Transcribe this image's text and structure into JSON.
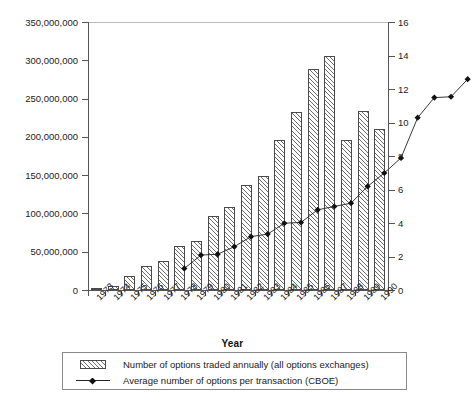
{
  "chart_data": {
    "type": "bar",
    "title": "",
    "xlabel": "Year",
    "ylabel": "",
    "ylabel_right": "",
    "grid": false,
    "legend_position": "bottom",
    "categories": [
      "1973",
      "1974",
      "1975",
      "1976",
      "1977",
      "1978",
      "1979",
      "1980",
      "1981",
      "1982",
      "1983",
      "1984",
      "1985",
      "1986",
      "1987",
      "1988",
      "1989",
      "1990"
    ],
    "ylim": [
      0,
      350000000
    ],
    "yticks": [
      0,
      50000000,
      100000000,
      150000000,
      200000000,
      250000000,
      300000000,
      350000000
    ],
    "ytick_labels": [
      "0",
      "50,000,000",
      "100,000,000",
      "150,000,000",
      "200,000,000",
      "250,000,000",
      "300,000,000",
      "350,000,000"
    ],
    "ylim_right": [
      0,
      16
    ],
    "yticks_right": [
      0,
      2,
      4,
      6,
      8,
      10,
      12,
      14,
      16
    ],
    "ytick_labels_right": [
      "0",
      "2",
      "4",
      "6",
      "8",
      "10",
      "12",
      "14",
      "16"
    ],
    "series": [
      {
        "name": "Number of options traded annually (all options exchanges)",
        "type": "bar",
        "axis": "left",
        "values": [
          1000000,
          5000000,
          18000000,
          31000000,
          38000000,
          57000000,
          64000000,
          97000000,
          109000000,
          137000000,
          149000000,
          196000000,
          233000000,
          288000000,
          306000000,
          196000000,
          234000000,
          210000000
        ]
      },
      {
        "name": "Average number of options per transaction (CBOE)",
        "type": "line",
        "axis": "right",
        "marker": "diamond",
        "values": [
          2.6,
          3.4,
          3.45,
          3.9,
          4.5,
          4.65,
          5.3,
          5.35,
          6.1,
          6.3,
          6.5,
          7.5,
          8.3,
          9.2,
          11.6,
          12.8,
          12.85,
          13.9
        ]
      }
    ]
  },
  "legend": {
    "items": [
      {
        "label": "Number of options traded annually (all options exchanges)",
        "swatch": "hatched-bar-swatch"
      },
      {
        "label": "Average number of options per transaction (CBOE)",
        "swatch": "diamond-line-swatch"
      }
    ]
  },
  "colors": {
    "axis": "#555555",
    "bar_outline": "#4a4a4a",
    "bar_hatch": "#6b6b6b",
    "line": "#222222",
    "marker": "#111111",
    "background": "#ffffff"
  }
}
